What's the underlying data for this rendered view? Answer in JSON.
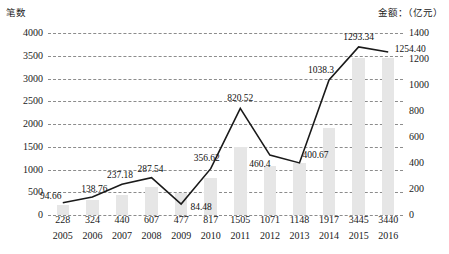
{
  "axes": {
    "left_title": "笔数",
    "right_title": "金额：（亿元）",
    "left_ticks": [
      "0",
      "500",
      "1000",
      "1500",
      "2000",
      "2500",
      "3000",
      "3500",
      "4000"
    ],
    "right_ticks": [
      "0",
      "200",
      "400",
      "600",
      "800",
      "1000",
      "1200",
      "1400"
    ]
  },
  "chart_data": {
    "type": "bar",
    "title": "",
    "subtitle": "",
    "xlabel": "",
    "ylabel": "笔数",
    "y2label": "金额：（亿元）",
    "grid": true,
    "legend": "none",
    "categories": [
      "2005",
      "2006",
      "2007",
      "2008",
      "2009",
      "2010",
      "2011",
      "2012",
      "2013",
      "2014",
      "2015",
      "2016"
    ],
    "ylim": [
      0,
      4000
    ],
    "y2lim": [
      0,
      1400
    ],
    "yticks": [
      0,
      500,
      1000,
      1500,
      2000,
      2500,
      3000,
      3500,
      4000
    ],
    "y2ticks": [
      0,
      200,
      400,
      600,
      800,
      1000,
      1200,
      1400
    ],
    "series": [
      {
        "name": "笔数",
        "type": "bar",
        "axis": "left",
        "color": "#e6e6e6",
        "values": [
          228,
          324,
          440,
          607,
          477,
          817,
          1505,
          1071,
          1148,
          1917,
          3445,
          3440
        ],
        "labels": [
          "228",
          "324",
          "440",
          "607",
          "477",
          "817",
          "1505",
          "1071",
          "1148",
          "1917",
          "3445",
          "3440"
        ]
      },
      {
        "name": "金额",
        "type": "line",
        "axis": "right",
        "color": "#1a1a1a",
        "values": [
          94.66,
          138.76,
          237.18,
          287.54,
          84.48,
          356.62,
          820.52,
          460.4,
          400.67,
          1038.3,
          1293.34,
          1254.4
        ],
        "labels": [
          "94.66",
          "138.76",
          "237.18",
          "287.54",
          "84.48",
          "356.62",
          "820.52",
          "460.4",
          "400.67",
          "1038.3",
          "1293.34",
          "1254.40"
        ]
      }
    ]
  }
}
